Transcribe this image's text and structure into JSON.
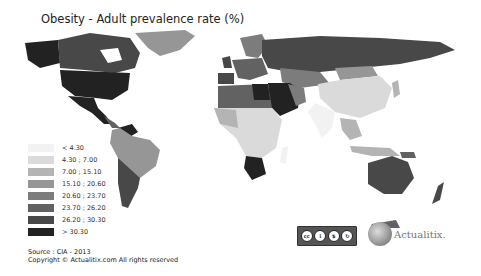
{
  "title": "Obesity - Adult prevalence rate (%)",
  "legend": {
    "items": [
      {
        "label": "< 4.30",
        "color": "#f2f2f2"
      },
      {
        "label": "4.30 ; 7.00",
        "color": "#dadada"
      },
      {
        "label": "7.00 ; 15.10",
        "color": "#b4b4b4"
      },
      {
        "label": "15.10 ; 20.60",
        "color": "#969696"
      },
      {
        "label": "20.60 ; 23.70",
        "color": "#7c7c7c"
      },
      {
        "label": "23.70 ; 26.20",
        "color": "#626262"
      },
      {
        "label": "26.20 ; 30.30",
        "color": "#484848"
      },
      {
        "label": "> 30.30",
        "color": "#222222"
      }
    ]
  },
  "source": "Source : CIA - 2013",
  "copyright": "Copyright © Actualitix.com All rights reserved",
  "license": {
    "badges": [
      "cc",
      "by",
      "nc",
      "sa"
    ],
    "labels": [
      "BY",
      "NC",
      "SA"
    ]
  },
  "logo": {
    "text": "Actualitix."
  }
}
